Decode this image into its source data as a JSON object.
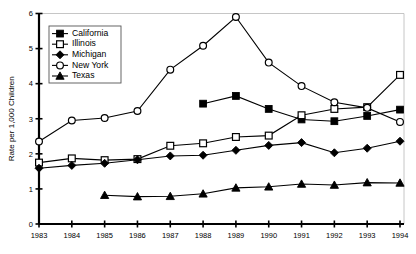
{
  "chart_data": {
    "type": "line",
    "title": "",
    "subtitle": "",
    "xlabel": "",
    "ylabel": "Rate per 1,000 Children",
    "categories": [
      "1983",
      "1984",
      "1985",
      "1986",
      "1987",
      "1988",
      "1989",
      "1990",
      "1991",
      "1992",
      "1993",
      "1994"
    ],
    "x": [
      1983,
      1984,
      1985,
      1986,
      1987,
      1988,
      1989,
      1990,
      1991,
      1992,
      1993,
      1994
    ],
    "xlim": [
      1983,
      1994
    ],
    "ylim": [
      0,
      6
    ],
    "yticks": [
      0,
      1,
      2,
      3,
      4,
      5,
      6
    ],
    "ytick_labels": [
      "0",
      "1",
      "2",
      "3",
      "4",
      "5",
      "6"
    ],
    "grid": false,
    "legend_position": "top-left",
    "series": [
      {
        "name": "California",
        "marker": "filled-square",
        "values": [
          null,
          null,
          null,
          null,
          null,
          3.43,
          3.65,
          3.28,
          2.98,
          2.93,
          3.08,
          3.26
        ]
      },
      {
        "name": "Illinois",
        "marker": "open-square",
        "values": [
          1.75,
          1.87,
          1.82,
          1.85,
          2.23,
          2.3,
          2.48,
          2.52,
          3.1,
          3.28,
          3.33,
          4.25
        ]
      },
      {
        "name": "Michigan",
        "marker": "filled-diamond",
        "values": [
          1.59,
          1.67,
          1.73,
          1.83,
          1.94,
          1.96,
          2.1,
          2.24,
          2.32,
          2.03,
          2.16,
          2.36
        ]
      },
      {
        "name": "New York",
        "marker": "open-circle",
        "values": [
          2.35,
          2.95,
          3.02,
          3.22,
          4.4,
          5.08,
          5.9,
          4.6,
          3.93,
          3.47,
          3.31,
          2.91
        ]
      },
      {
        "name": "Texas",
        "marker": "filled-triangle",
        "values": [
          null,
          null,
          0.82,
          0.78,
          0.79,
          0.86,
          1.03,
          1.06,
          1.14,
          1.11,
          1.18,
          1.17
        ]
      }
    ]
  },
  "legend": {
    "entries": [
      {
        "label": "California",
        "marker": "filled-square"
      },
      {
        "label": "Illinois",
        "marker": "open-square"
      },
      {
        "label": "Michigan",
        "marker": "filled-diamond"
      },
      {
        "label": "New York",
        "marker": "open-circle"
      },
      {
        "label": "Texas",
        "marker": "filled-triangle"
      }
    ]
  },
  "colors": {
    "line": "#000000",
    "axis": "#000000",
    "frame": "#b8b8b8",
    "background": "#ffffff",
    "marker_fill_open": "#ffffff"
  }
}
